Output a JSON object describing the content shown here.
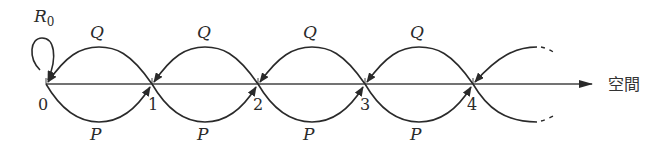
{
  "diagram": {
    "type": "random-walk-state-diagram",
    "axis_label": "空間",
    "self_loop_label": "R",
    "self_loop_subscript": "0",
    "forward_label": "P",
    "backward_label": "Q",
    "nodes": [
      "0",
      "1",
      "2",
      "3",
      "4"
    ],
    "colors": {
      "stroke": "#2a2a2a",
      "axis": "#444444"
    }
  }
}
